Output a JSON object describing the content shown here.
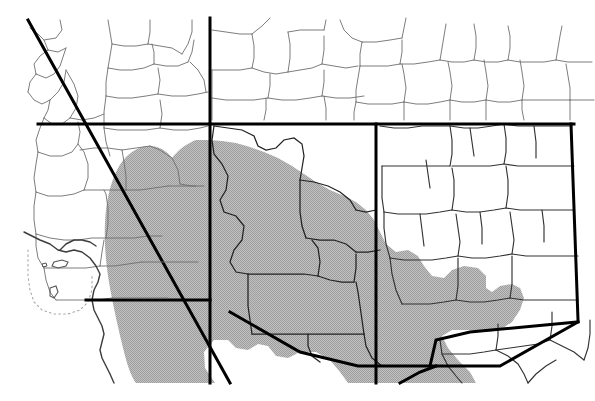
{
  "map": {
    "title": "Southwestern United States distribution range map",
    "type": "range-map",
    "region_label": "Southwestern United States",
    "background_color": "#ffffff",
    "ink_color": "#000000",
    "range_fill_color": "#b4b4b4",
    "range_fill_label": "Shaded distribution range",
    "county_line_color": "#6e6e6e",
    "county_line_width": 0.8,
    "state_line_color": "#000000",
    "state_line_width": 3.0,
    "coast_line_color": "#3c3c3c",
    "coast_line_width": 1.4,
    "island_line_color": "#9a9a9a",
    "island_line_style": "dotted",
    "canvas": {
      "width": 595,
      "height": 401
    },
    "content_bounds": {
      "left": 18,
      "top": 16,
      "right": 595,
      "bottom": 383
    },
    "states": [
      {
        "code": "CA",
        "name": "California"
      },
      {
        "code": "NV",
        "name": "Nevada"
      },
      {
        "code": "UT",
        "name": "Utah"
      },
      {
        "code": "AZ",
        "name": "Arizona"
      },
      {
        "code": "NM",
        "name": "New Mexico"
      },
      {
        "code": "CO",
        "name": "Colorado"
      },
      {
        "code": "TX",
        "name": "Texas"
      }
    ],
    "features": [
      {
        "name": "california-nevada-diagonal-border",
        "kind": "state-line"
      },
      {
        "name": "nevada-utah-vertical-border",
        "kind": "state-line"
      },
      {
        "name": "utah-arizona-horizontal-border",
        "kind": "state-line"
      },
      {
        "name": "arizona-new-mexico-vertical-border",
        "kind": "state-line"
      },
      {
        "name": "new-mexico-texas-eastern-border",
        "kind": "state-line"
      },
      {
        "name": "us-mexico-southern-border",
        "kind": "state-line"
      },
      {
        "name": "pacific-coastline",
        "kind": "coastline"
      },
      {
        "name": "channel-islands",
        "kind": "island-group"
      },
      {
        "name": "range-shading-polygon",
        "kind": "range-area"
      }
    ]
  }
}
